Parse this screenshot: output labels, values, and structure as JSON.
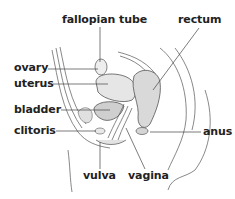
{
  "diagram": {
    "labels": {
      "fallopian_tube": "fallopian tube",
      "rectum": "rectum",
      "ovary": "ovary",
      "uterus": "uterus",
      "bladder": "bladder",
      "clitoris": "clitoris",
      "anus": "anus",
      "vulva": "vulva",
      "vagina": "vagina"
    },
    "colors": {
      "line": "#444444",
      "text": "#222222",
      "shade": "#d8d8d8"
    }
  }
}
